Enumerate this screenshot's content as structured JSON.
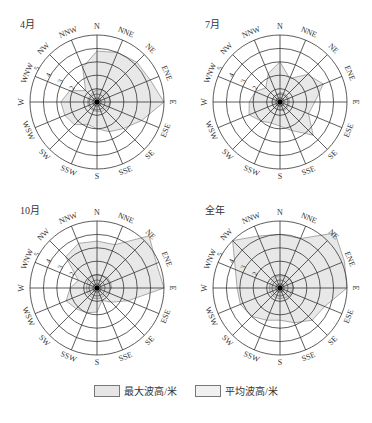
{
  "chart_data": {
    "type": "radar",
    "directions": [
      "N",
      "NNE",
      "NE",
      "ENE",
      "E",
      "ESE",
      "SE",
      "SSE",
      "S",
      "SSW",
      "SW",
      "WSW",
      "W",
      "WNW",
      "NW",
      "NNW"
    ],
    "radial_ticks": [
      1,
      2,
      3,
      4,
      5
    ],
    "radial_tick_labels": [
      "2",
      "3",
      "4",
      "5"
    ],
    "rmax": 5,
    "legend": [
      {
        "name": "最大波高/米",
        "color": "#e6e6e6"
      },
      {
        "name": "平均波高/米",
        "color": "#f0f0f0"
      }
    ],
    "panels": [
      {
        "title": "4月",
        "series": [
          {
            "name": "最大波高/米",
            "values": [
              3.8,
              4.0,
              4.2,
              4.3,
              5.0,
              3.6,
              2.8,
              2.4,
              2.0,
              1.8,
              2.4,
              2.6,
              2.7,
              2.2,
              1.2,
              2.8
            ]
          },
          {
            "name": "平均波高/米",
            "values": [
              0.9,
              1.0,
              1.0,
              1.0,
              1.0,
              0.9,
              0.8,
              0.8,
              0.7,
              0.7,
              0.7,
              0.7,
              0.7,
              0.7,
              0.7,
              0.8
            ]
          }
        ]
      },
      {
        "title": "7月",
        "series": [
          {
            "name": "最大波高/米",
            "values": [
              3.0,
              1.9,
              2.9,
              3.5,
              2.6,
              2.3,
              3.5,
              2.3,
              1.8,
              1.7,
              2.0,
              2.5,
              2.3,
              2.0,
              1.5,
              2.3
            ]
          },
          {
            "name": "平均波高/米",
            "values": [
              0.7,
              0.7,
              0.7,
              0.7,
              0.7,
              0.7,
              0.7,
              0.7,
              0.6,
              0.6,
              0.6,
              0.6,
              0.6,
              0.6,
              0.6,
              0.6
            ]
          }
        ]
      },
      {
        "title": "10月",
        "series": [
          {
            "name": "最大波高/米",
            "values": [
              3.5,
              3.5,
              5.5,
              4.8,
              5.0,
              2.5,
              1.5,
              1.0,
              1.8,
              2.0,
              2.2,
              2.5,
              2.0,
              1.5,
              3.3,
              3.6
            ]
          },
          {
            "name": "平均波高/米",
            "values": [
              1.0,
              1.0,
              1.1,
              1.1,
              1.1,
              0.9,
              0.8,
              0.8,
              0.8,
              0.8,
              0.8,
              0.8,
              0.8,
              0.8,
              0.9,
              1.0
            ]
          }
        ]
      },
      {
        "title": "全年",
        "series": [
          {
            "name": "最大波高/米",
            "values": [
              4.0,
              4.0,
              5.8,
              5.2,
              5.0,
              3.6,
              3.4,
              2.8,
              2.4,
              2.6,
              3.0,
              3.2,
              3.2,
              3.6,
              5.0,
              4.2
            ]
          },
          {
            "name": "平均波高/米",
            "values": [
              0.9,
              1.0,
              1.0,
              1.0,
              1.0,
              0.9,
              0.9,
              0.8,
              0.8,
              0.8,
              0.8,
              0.8,
              0.8,
              0.8,
              0.8,
              0.9
            ]
          }
        ]
      }
    ]
  }
}
